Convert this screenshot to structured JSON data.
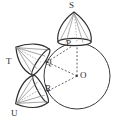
{
  "figure": {
    "name": "circle-with-three-cones-diagram",
    "type": "geometry-diagram",
    "canvas": {
      "width": 120,
      "height": 129,
      "background": "#ffffff"
    },
    "colors": {
      "stroke": "#333333",
      "label": "#2b2b2b",
      "dash": "#555555",
      "fill": "#ffffff"
    },
    "circle": {
      "label": "main-circle",
      "center_label": "O",
      "cx": 77,
      "cy": 76,
      "r": 33
    },
    "points": [
      {
        "id": "O",
        "label": "O",
        "x": 77,
        "y": 76,
        "role": "circle-center",
        "label_x": 80,
        "label_y": 72
      },
      {
        "id": "P",
        "label": "P",
        "x": 77,
        "y": 43,
        "role": "tangent-point-top",
        "label_x": 67,
        "label_y": 41
      },
      {
        "id": "Q",
        "label": "Q",
        "x": 47,
        "y": 62,
        "role": "tangent-point-upper-left",
        "label_x": 47,
        "label_y": 60
      },
      {
        "id": "R",
        "label": "R",
        "x": 48,
        "y": 91,
        "role": "tangent-point-lower-left",
        "label_x": 47,
        "label_y": 87
      },
      {
        "id": "S",
        "label": "S",
        "x": 74,
        "y": 12,
        "role": "cone-apex-top",
        "label_x": 69,
        "label_y": 1
      },
      {
        "id": "T",
        "label": "T",
        "x": 21,
        "y": 55,
        "role": "cone-apex-left",
        "label_x": 6,
        "label_y": 58
      },
      {
        "id": "U",
        "label": "U",
        "x": 24,
        "y": 104,
        "role": "cone-apex-lower-left",
        "label_x": 11,
        "label_y": 110
      }
    ],
    "segments": [
      {
        "id": "OP",
        "from": "O",
        "to": "P",
        "style": "dashed"
      },
      {
        "id": "OQ",
        "from": "O",
        "to": "Q",
        "style": "dashed"
      },
      {
        "id": "OR",
        "from": "O",
        "to": "R",
        "style": "dashed"
      },
      {
        "id": "QP",
        "from": "Q",
        "to": "P",
        "style": "dashed"
      }
    ],
    "cones": [
      {
        "id": "cone-S",
        "apex": "S",
        "base_point": "P",
        "direction": "up"
      },
      {
        "id": "cone-T",
        "apex": "T",
        "base_point": "Q",
        "direction": "upper-left"
      },
      {
        "id": "cone-U",
        "apex": "U",
        "base_point": "R",
        "direction": "lower-left"
      }
    ],
    "labels": [
      "S",
      "P",
      "T",
      "Q",
      "O",
      "R",
      "U"
    ]
  }
}
